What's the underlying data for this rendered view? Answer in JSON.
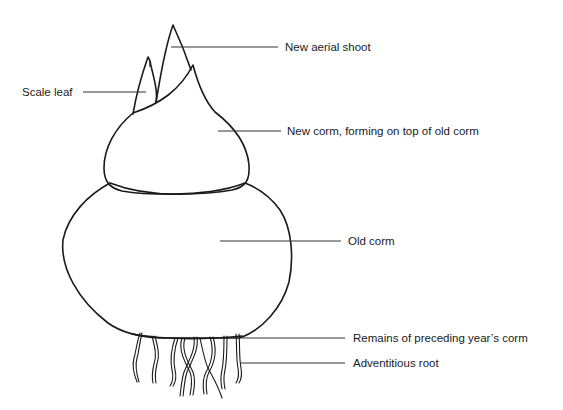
{
  "diagram": {
    "labels": {
      "new_aerial_shoot": "New aerial shoot",
      "scale_leaf": "Scale leaf",
      "new_corm": "New corm, forming on top of old corm",
      "old_corm": "Old corm",
      "remains": "Remains of preceding year’s corm",
      "adventitious_root": "Adventitious root"
    },
    "colors": {
      "line": "#1a1a1a",
      "background": "#ffffff"
    }
  }
}
